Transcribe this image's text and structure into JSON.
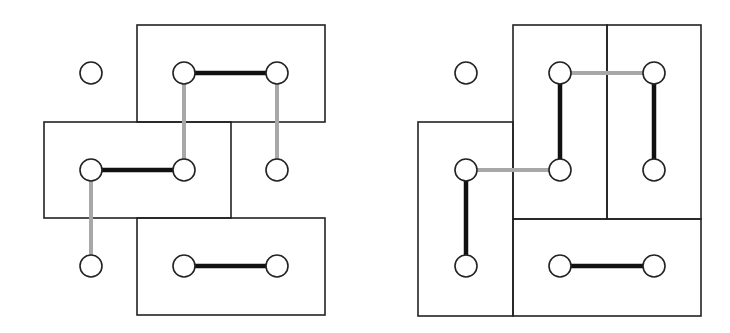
{
  "colors": {
    "background": "#ffffff",
    "box_stroke": "#222222",
    "node_stroke": "#222222",
    "node_fill": "#ffffff",
    "edge_matched": "#111111",
    "edge_unmatched": "#a8a8a8"
  },
  "node_radius": 11,
  "diagrams": [
    {
      "id": "left-diagram",
      "boxes": [
        {
          "name": "box-top",
          "x": 137,
          "y": 25,
          "w": 188,
          "h": 97
        },
        {
          "name": "box-middle",
          "x": 44,
          "y": 122,
          "w": 187,
          "h": 96
        },
        {
          "name": "box-bottom",
          "x": 137,
          "y": 218,
          "w": 188,
          "h": 97
        }
      ],
      "nodes": [
        {
          "id": "a1",
          "x": 91,
          "y": 73
        },
        {
          "id": "a2",
          "x": 184,
          "y": 73
        },
        {
          "id": "a3",
          "x": 277,
          "y": 73
        },
        {
          "id": "b1",
          "x": 91,
          "y": 170
        },
        {
          "id": "b2",
          "x": 184,
          "y": 170
        },
        {
          "id": "b3",
          "x": 277,
          "y": 170
        },
        {
          "id": "c1",
          "x": 91,
          "y": 266
        },
        {
          "id": "c2",
          "x": 184,
          "y": 266
        },
        {
          "id": "c3",
          "x": 277,
          "y": 266
        }
      ],
      "edges": [
        {
          "from": "a2",
          "to": "a3",
          "type": "matched"
        },
        {
          "from": "b1",
          "to": "b2",
          "type": "matched"
        },
        {
          "from": "c2",
          "to": "c3",
          "type": "matched"
        },
        {
          "from": "a2",
          "to": "b2",
          "type": "unmatched"
        },
        {
          "from": "a3",
          "to": "b3",
          "type": "unmatched"
        },
        {
          "from": "b1",
          "to": "c1",
          "type": "unmatched"
        }
      ]
    },
    {
      "id": "right-diagram",
      "boxes": [
        {
          "name": "box-left-tall",
          "x": 418,
          "y": 122,
          "w": 95,
          "h": 194
        },
        {
          "name": "box-top-middle",
          "x": 513,
          "y": 25,
          "w": 94,
          "h": 194
        },
        {
          "name": "box-top-right",
          "x": 607,
          "y": 25,
          "w": 94,
          "h": 194
        },
        {
          "name": "box-bottom-wide",
          "x": 513,
          "y": 219,
          "w": 188,
          "h": 97
        }
      ],
      "nodes": [
        {
          "id": "a1",
          "x": 466,
          "y": 73
        },
        {
          "id": "a2",
          "x": 560,
          "y": 73
        },
        {
          "id": "a3",
          "x": 654,
          "y": 73
        },
        {
          "id": "b1",
          "x": 466,
          "y": 170
        },
        {
          "id": "b2",
          "x": 560,
          "y": 170
        },
        {
          "id": "b3",
          "x": 654,
          "y": 170
        },
        {
          "id": "c1",
          "x": 466,
          "y": 266
        },
        {
          "id": "c2",
          "x": 560,
          "y": 266
        },
        {
          "id": "c3",
          "x": 654,
          "y": 266
        }
      ],
      "edges": [
        {
          "from": "a2",
          "to": "b2",
          "type": "matched"
        },
        {
          "from": "a3",
          "to": "b3",
          "type": "matched"
        },
        {
          "from": "b1",
          "to": "c1",
          "type": "matched"
        },
        {
          "from": "c2",
          "to": "c3",
          "type": "matched"
        },
        {
          "from": "a2",
          "to": "a3",
          "type": "unmatched"
        },
        {
          "from": "b1",
          "to": "b2",
          "type": "unmatched"
        }
      ]
    }
  ]
}
